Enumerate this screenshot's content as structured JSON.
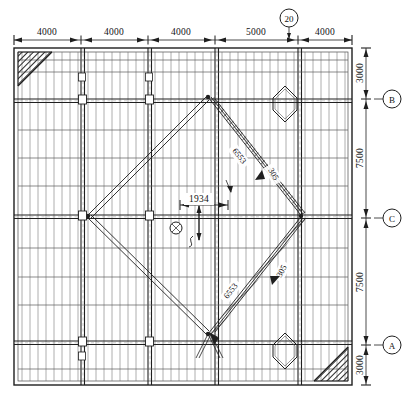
{
  "drawing": {
    "type": "structural-framing-plan",
    "title": "",
    "background": "#ffffff",
    "line_color": "#1f1f1f",
    "hatch_color": "#2a2a2a"
  },
  "top_dimension_chain": {
    "name": "horizontal-dimension-chain",
    "units": "mm",
    "segments": [
      {
        "label": "4000",
        "x_start": 14,
        "x_end": 81
      },
      {
        "label": "4000",
        "x_start": 81,
        "x_end": 148
      },
      {
        "label": "4000",
        "x_start": 148,
        "x_end": 215
      },
      {
        "label": "5000",
        "x_start": 215,
        "x_end": 298
      },
      {
        "label": "4000",
        "x_start": 298,
        "x_end": 352
      }
    ],
    "total": "21000"
  },
  "right_dimension_chain": {
    "name": "vertical-dimension-chain",
    "units": "mm",
    "segments": [
      {
        "label": "3000",
        "y_start": 48,
        "y_end": 99
      },
      {
        "label": "7500",
        "y_start": 99,
        "y_end": 218
      },
      {
        "label": "7500",
        "y_start": 218,
        "y_end": 345
      },
      {
        "label": "3000",
        "y_start": 345,
        "y_end": 385
      }
    ],
    "total": "21000"
  },
  "grid_bubbles": [
    {
      "id": "bubble-top-20",
      "label": "20",
      "cx": 289,
      "cy": 18,
      "r": 9,
      "leader_to_y": 38
    },
    {
      "id": "bubble-right-b",
      "label": "B",
      "cx": 392,
      "cy": 99,
      "r": 9,
      "leader_to_x": 356
    },
    {
      "id": "bubble-right-c",
      "label": "C",
      "cx": 392,
      "cy": 218,
      "r": 9,
      "leader_to_x": 356
    },
    {
      "id": "bubble-right-a",
      "label": "A",
      "cx": 392,
      "cy": 345,
      "r": 9,
      "leader_to_x": 356
    }
  ],
  "annotations": {
    "center_dimension": {
      "name": "center-offset-dimension",
      "label": "1934",
      "x_start": 180,
      "x_end": 228,
      "y": 205
    },
    "center_callout": {
      "name": "center-node-callout",
      "marker": "circle-node",
      "cx": 176,
      "cy": 228,
      "r": 6
    },
    "diagonal_labels": [
      {
        "name": "diagonal-label-upper-right",
        "text": "6553",
        "x": 238,
        "y": 157,
        "rotate": 52
      },
      {
        "name": "diagonal-label-upper-right-member",
        "text": "305",
        "x": 272,
        "y": 175,
        "rotate": 60
      },
      {
        "name": "diagonal-label-lower-right",
        "text": "6553",
        "x": 232,
        "y": 292,
        "rotate": -52
      },
      {
        "name": "diagonal-label-lower-right-member",
        "text": "305",
        "x": 283,
        "y": 272,
        "rotate": -62
      }
    ]
  },
  "plan": {
    "outer_frame": {
      "x": 14,
      "y": 48,
      "w": 338,
      "h": 337
    },
    "main_bays_x": [
      14,
      81,
      148,
      215,
      298,
      352
    ],
    "main_bays_y": [
      48,
      99,
      218,
      345,
      385
    ],
    "joist_spacing_px": 8,
    "corner_gussets": [
      {
        "name": "corner-gusset-top-left",
        "corner": "tl"
      },
      {
        "name": "corner-gusset-bottom-right",
        "corner": "br"
      }
    ],
    "diamond_nodes": [
      {
        "name": "diamond-node-top-right",
        "cx": 285,
        "cy": 104,
        "r": 18
      },
      {
        "name": "diamond-node-bottom-right",
        "cx": 285,
        "cy": 351,
        "r": 18
      }
    ],
    "bracing": {
      "name": "x-bracing-diamond",
      "apex_top": {
        "x": 208,
        "y": 97
      },
      "apex_bottom": {
        "x": 208,
        "y": 333
      },
      "node_left": {
        "x": 88,
        "y": 215
      },
      "node_right": {
        "x": 298,
        "y": 215
      }
    }
  }
}
